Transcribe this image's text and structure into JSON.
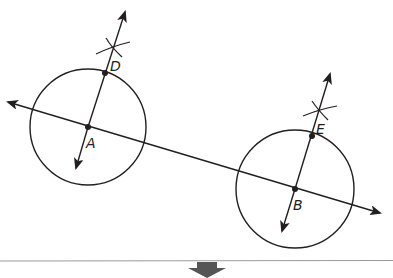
{
  "diagram": {
    "colors": {
      "stroke": "#231f20",
      "rule": "#9a9a9a",
      "arrow_block": "#555555",
      "background": "#ffffff"
    },
    "points": [
      {
        "label": "A",
        "x": 88,
        "y": 127
      },
      {
        "label": "B",
        "x": 295,
        "y": 189
      },
      {
        "label": "D",
        "x": 105,
        "y": 73
      },
      {
        "label": "E",
        "x": 312,
        "y": 136
      }
    ],
    "circles": [
      {
        "center": "A",
        "cx": 88,
        "cy": 127,
        "r": 58
      },
      {
        "center": "B",
        "cx": 295,
        "cy": 189,
        "r": 59
      }
    ],
    "lines": [
      {
        "name": "line AB",
        "x1": 8,
        "y1": 102,
        "x2": 380,
        "y2": 213,
        "arrows": "both"
      },
      {
        "name": "perpendicular through A and D",
        "x1": 125,
        "y1": 12,
        "x2": 76,
        "y2": 168,
        "arrows": "both"
      },
      {
        "name": "perpendicular through B and E",
        "x1": 330,
        "y1": 74,
        "x2": 282,
        "y2": 231,
        "arrows": "both"
      }
    ],
    "arc_marks": [
      {
        "near": "D",
        "x": 113,
        "y": 48
      },
      {
        "near": "E",
        "x": 320,
        "y": 110
      }
    ],
    "labels": {
      "A": "A",
      "B": "B",
      "D": "D",
      "E": "E"
    }
  },
  "footer": {
    "divider": "horizontal gray rule",
    "indicator": "down-arrow"
  }
}
